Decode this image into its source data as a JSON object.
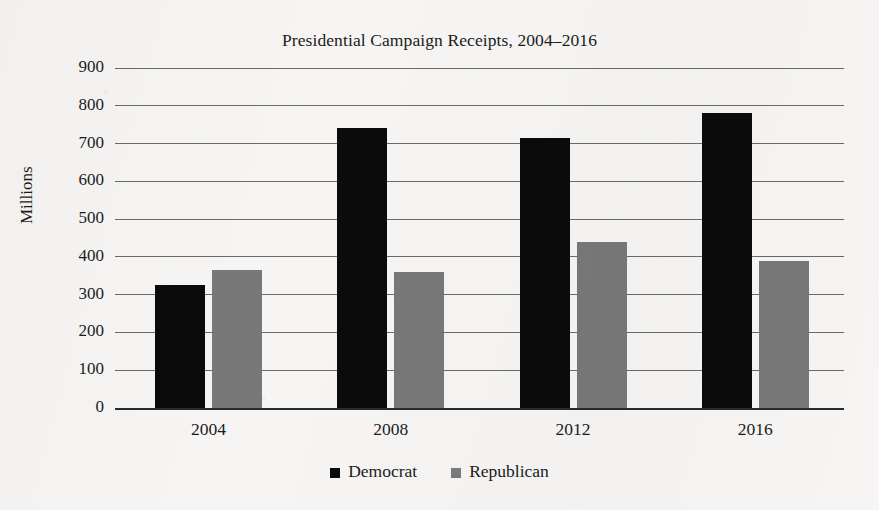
{
  "chart_data": {
    "type": "bar",
    "title": "Presidential Campaign Receipts, 2004–2016",
    "xlabel": "",
    "ylabel": "Millions",
    "categories": [
      "2004",
      "2008",
      "2012",
      "2016"
    ],
    "series": [
      {
        "name": "Democrat",
        "color": "#0b0b0b",
        "values": [
          325,
          740,
          715,
          780
        ]
      },
      {
        "name": "Republican",
        "color": "#787878",
        "values": [
          365,
          360,
          440,
          390
        ]
      }
    ],
    "ylim": [
      0,
      900
    ],
    "ytick_labels": [
      "900",
      "800",
      "700",
      "600",
      "500",
      "400",
      "300",
      "200",
      "100",
      "0"
    ],
    "ytick_values": [
      900,
      800,
      700,
      600,
      500,
      400,
      300,
      200,
      100,
      0
    ],
    "grid": true,
    "legend_position": "bottom"
  },
  "legend": {
    "items": [
      {
        "label": "Democrat",
        "swatch": "democrat"
      },
      {
        "label": "Republican",
        "swatch": "republican"
      }
    ]
  }
}
